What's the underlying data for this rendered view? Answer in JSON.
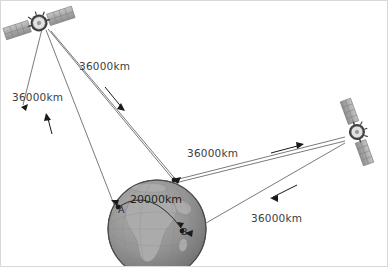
{
  "diagram": {
    "background_color": "#ffffff",
    "border_color": "#d8d8d8",
    "line_color": "#6b6b6b",
    "arrow_color": "#1a1a1a",
    "text_color": "#3d3d3d",
    "globe": {
      "name": "earth-globe",
      "ocean_color": "#8e8e8e",
      "land_color": "#a9a9a9",
      "outline_color": "#4a4a4a",
      "center_x": 156,
      "center_y": 228,
      "radius": 49
    },
    "satellites": [
      {
        "name": "satellite-left",
        "x": 38,
        "y": 22,
        "rotation_deg": -18,
        "panel_color": "#b3b3b3",
        "body_color": "#d9d9d9"
      },
      {
        "name": "satellite-right",
        "x": 356,
        "y": 131,
        "rotation_deg": 70,
        "panel_color": "#b3b3b3",
        "body_color": "#d9d9d9"
      }
    ],
    "ground_points": [
      {
        "name": "point-a",
        "label": "A",
        "x": 117,
        "y": 208
      },
      {
        "name": "point-b",
        "label": "B",
        "x": 181,
        "y": 231
      }
    ],
    "distance_labels": [
      {
        "name": "distance-label-uplink-top",
        "text": "36000km"
      },
      {
        "name": "distance-label-downlink-left",
        "text": "36000km"
      },
      {
        "name": "distance-label-crosslink",
        "text": "36000km"
      },
      {
        "name": "distance-label-downlink-right",
        "text": "36000km"
      }
    ],
    "arc_label": {
      "name": "surface-distance-label",
      "text": "20000km"
    },
    "arrows": [
      {
        "name": "arrow-up-to-left-satellite",
        "direction": "up-left"
      },
      {
        "name": "arrow-down-from-left-satellite",
        "direction": "down-right"
      },
      {
        "name": "arrow-right-crosslink",
        "direction": "right"
      },
      {
        "name": "arrow-down-left-to-point-b",
        "direction": "down-left"
      }
    ]
  }
}
